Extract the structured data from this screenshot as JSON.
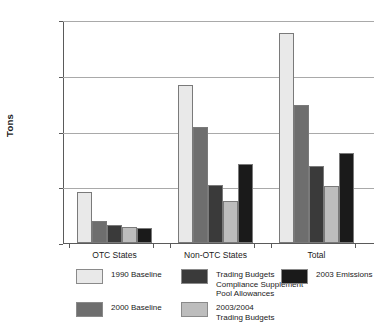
{
  "chart_data": {
    "type": "bar",
    "title": "",
    "subtitle": "",
    "xlabel": "",
    "ylabel": "Tons",
    "ylim": [
      0,
      2000000
    ],
    "ytick_values": [
      0,
      500000,
      1000000,
      1500000,
      2000000
    ],
    "ytick_labels": [
      "0",
      "500,000",
      "1,000,000",
      "1,500,000",
      "2,000,000"
    ],
    "grid": true,
    "legend_position": "bottom",
    "categories": [
      "OTC States",
      "Non-OTC States",
      "Total"
    ],
    "series": [
      {
        "name": "1990 Baseline",
        "color": "#e9e9e9",
        "values": [
          460000,
          1420000,
          1880000
        ]
      },
      {
        "name": "2000 Baseline",
        "color": "#6e6e6e",
        "values": [
          200000,
          1040000,
          1237000
        ]
      },
      {
        "name": "Trading Budgets\nCompliance Supplement\nPool Allowances",
        "color": "#3a3a3a",
        "values": [
          163000,
          520000,
          690000
        ]
      },
      {
        "name": "2003/2004\nTrading Budgets",
        "color": "#bdbdbd",
        "values": [
          145000,
          377000,
          513000
        ]
      },
      {
        "name": "2003 Emissions",
        "color": "#1a1a1a",
        "values": [
          137000,
          708000,
          808000
        ]
      }
    ]
  },
  "axis": {
    "y_title": "Tons",
    "ticks": [
      {
        "label": "2,000,000",
        "value": 2000000
      },
      {
        "label": "1,500,000",
        "value": 1500000
      },
      {
        "label": "1,000,000",
        "value": 1000000
      },
      {
        "label": "500,000",
        "value": 500000
      },
      {
        "label": "0",
        "value": 0
      }
    ]
  },
  "categories": [
    {
      "label": "OTC States"
    },
    {
      "label": "Non-OTC States"
    },
    {
      "label": "Total"
    }
  ],
  "legend": {
    "items": [
      {
        "label": "1990 Baseline",
        "color": "#e9e9e9"
      },
      {
        "label": "2000 Baseline",
        "color": "#6e6e6e"
      },
      {
        "label": "Trading Budgets\nCompliance Supplement\nPool Allowances",
        "color": "#3a3a3a"
      },
      {
        "label": "2003/2004\nTrading Budgets",
        "color": "#bdbdbd"
      },
      {
        "label": "2003 Emissions",
        "color": "#1a1a1a"
      }
    ]
  }
}
